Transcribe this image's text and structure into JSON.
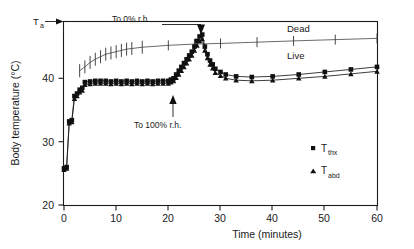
{
  "figure": {
    "type": "scientific-line-chart",
    "background": "#ffffff",
    "foreground": "#1a1a1a"
  },
  "axes": {
    "y_title": "Body temperature (°C)",
    "x_title": "Time (minutes)",
    "y_ticks": [
      "20",
      "30",
      "40"
    ],
    "x_ticks": [
      "0",
      "10",
      "20",
      "30",
      "40",
      "50",
      "60"
    ],
    "ylim": [
      20,
      50
    ],
    "xlim": [
      0,
      60
    ]
  },
  "annotations": {
    "ambient": {
      "label": "T",
      "sub": "a"
    },
    "dry": "To 0% r.h.",
    "humid": "To 100% r.h.",
    "dead_label": "Dead",
    "live_label": "Live"
  },
  "legend": {
    "items": [
      {
        "marker": "square",
        "label": "T",
        "sub": "thx"
      },
      {
        "marker": "triangle",
        "label": "T",
        "sub": "abd"
      }
    ]
  },
  "chart_data": {
    "type": "line",
    "title": "",
    "xlabel": "Time (minutes)",
    "ylabel": "Body temperature (°C)",
    "xlim": [
      0,
      60
    ],
    "ylim": [
      20,
      50
    ],
    "grid": false,
    "legend_position": "inside-lower-right",
    "annotations": [
      {
        "text": "To 0% r.h.",
        "x": 14,
        "y": 49.3,
        "arrow_to_x": 26,
        "arrow_to_y": 47.5
      },
      {
        "text": "To 100% r.h.",
        "x": 16,
        "y": 34.5,
        "arrow_to_x": 21,
        "arrow_to_y": 38.0
      },
      {
        "text": "Dead",
        "x": 37,
        "y": 47.0
      },
      {
        "text": "Live",
        "x": 37,
        "y": 43.6
      },
      {
        "text": "Ta",
        "x": -4,
        "y": 49.8
      }
    ],
    "series": [
      {
        "name": "Dead",
        "marker": "tick",
        "has_error_bars": true,
        "x": [
          3,
          4,
          5,
          6,
          7,
          8,
          9,
          10,
          11,
          12,
          13,
          15,
          20,
          25,
          30,
          37,
          44,
          52,
          60
        ],
        "y": [
          41.2,
          41.8,
          42.5,
          43.0,
          43.4,
          43.8,
          44.0,
          44.2,
          44.4,
          44.6,
          44.7,
          44.9,
          45.2,
          45.4,
          45.5,
          45.7,
          45.9,
          46.1,
          46.3
        ]
      },
      {
        "name": "T_thx",
        "marker": "square",
        "x": [
          0,
          0.5,
          1,
          1.5,
          2,
          2.5,
          3,
          3.5,
          4,
          5,
          6,
          7,
          8,
          9,
          10,
          11,
          12,
          13,
          14,
          15,
          16,
          17,
          18,
          19,
          20,
          20.5,
          21,
          21.5,
          22,
          22.5,
          23,
          23.5,
          24,
          24.5,
          25,
          25.5,
          26,
          26.5,
          27,
          27.5,
          28,
          28.5,
          29,
          30,
          31,
          33,
          36,
          40,
          45,
          50,
          55,
          60
        ],
        "y": [
          25.8,
          26.0,
          33.2,
          33.4,
          37.2,
          37.6,
          38.2,
          38.5,
          39.4,
          39.5,
          39.6,
          39.6,
          39.6,
          39.5,
          39.6,
          39.5,
          39.6,
          39.5,
          39.6,
          39.5,
          39.6,
          39.5,
          39.6,
          39.6,
          39.6,
          39.8,
          40.0,
          40.6,
          41.2,
          41.8,
          42.4,
          43.0,
          43.6,
          44.2,
          45.0,
          45.9,
          46.6,
          46.9,
          45.0,
          43.8,
          42.8,
          42.2,
          41.5,
          41.0,
          40.6,
          40.3,
          40.2,
          40.3,
          40.6,
          41.0,
          41.4,
          41.8
        ]
      },
      {
        "name": "T_abd",
        "marker": "triangle",
        "x": [
          0,
          0.5,
          1,
          1.5,
          2,
          2.5,
          3,
          3.5,
          4,
          5,
          6,
          7,
          8,
          9,
          10,
          11,
          12,
          13,
          14,
          15,
          16,
          17,
          18,
          19,
          20,
          20.5,
          21,
          21.5,
          22,
          22.5,
          23,
          23.5,
          24,
          24.5,
          25,
          25.5,
          26,
          26.5,
          27,
          27.5,
          28,
          28.5,
          29,
          30,
          31,
          33,
          36,
          40,
          45,
          50,
          55,
          60
        ],
        "y": [
          25.6,
          25.8,
          32.9,
          33.1,
          36.8,
          37.2,
          37.8,
          38.1,
          39.0,
          39.1,
          39.2,
          39.2,
          39.2,
          39.1,
          39.2,
          39.1,
          39.2,
          39.1,
          39.2,
          39.1,
          39.2,
          39.1,
          39.2,
          39.2,
          39.2,
          39.4,
          39.6,
          40.1,
          40.6,
          41.2,
          41.8,
          42.4,
          43.0,
          43.6,
          44.4,
          45.2,
          45.9,
          46.2,
          44.4,
          43.2,
          42.2,
          41.6,
          40.9,
          40.4,
          40.0,
          39.7,
          39.6,
          39.7,
          40.0,
          40.3,
          40.7,
          41.1
        ]
      }
    ]
  }
}
